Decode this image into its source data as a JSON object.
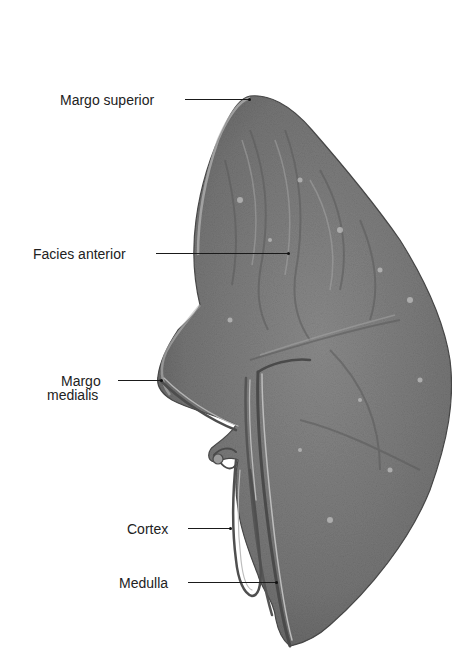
{
  "figure": {
    "colors": {
      "organ_fill": "#7d7d7d",
      "organ_dark": "#555555",
      "organ_light": "#b0b0b0",
      "label_text": "#222222",
      "leader_line": "#1a1a1a",
      "background": "#ffffff"
    },
    "labels": [
      {
        "id": "margo-superior",
        "text": "Margo superior"
      },
      {
        "id": "facies-anterior",
        "text": "Facies anterior"
      },
      {
        "id": "margo-medialis-line1",
        "text": "Margo"
      },
      {
        "id": "margo-medialis-line2",
        "text": "medialis"
      },
      {
        "id": "cortex",
        "text": "Cortex"
      },
      {
        "id": "medulla",
        "text": "Medulla"
      }
    ]
  }
}
